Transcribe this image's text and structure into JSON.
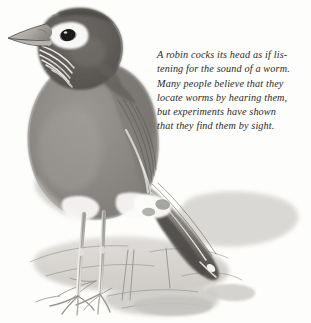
{
  "illustration": {
    "subject": "robin",
    "medium_look": "grayscale watercolor wash with pencil line",
    "background_color": "#fdfdfc",
    "palette": {
      "crown_dark": "#5d5a57",
      "body_mid": "#8b8884",
      "body_light": "#a9a6a2",
      "wash_pale": "#c9c7c3",
      "ground_pale": "#d6d5d1",
      "accent_white": "#fdfdfd",
      "line_dark": "#3a3835",
      "eye_black": "#1d1b1a",
      "text_color": "#2b2a28"
    }
  },
  "caption": {
    "text": "A robin cocks its head as if lis-\ntening for the sound of a worm.\nMany people believe that they\nlocate worms by hearing them,\nbut experiments have shown\nthat they find them by sight.",
    "lines": [
      "A robin cocks its head as if lis-",
      "tening for the sound of a worm.",
      "Many people believe that they",
      "locate worms by hearing them,",
      "but experiments have shown",
      "that they find them by sight."
    ]
  }
}
